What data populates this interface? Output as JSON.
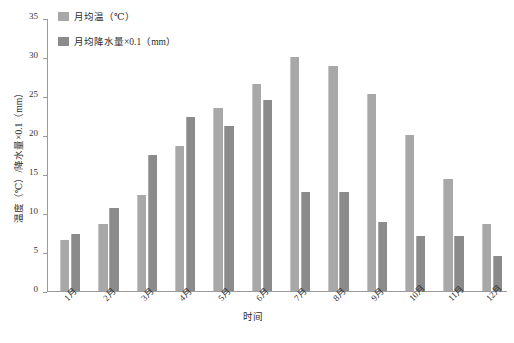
{
  "chart_data": {
    "type": "bar",
    "title": "",
    "xlabel": "时间",
    "ylabel": "温度（℃）/降水量×0.1（mm）",
    "categories": [
      "1月",
      "2月",
      "3月",
      "4月",
      "5月",
      "6月",
      "7月",
      "8月",
      "9月",
      "10月",
      "11月",
      "12月"
    ],
    "series": [
      {
        "name": "月均温（℃）",
        "color": "#a8a8a8",
        "values": [
          6.5,
          8.6,
          12.3,
          18.6,
          23.4,
          26.6,
          30.0,
          28.9,
          25.2,
          20.0,
          14.4,
          8.6
        ]
      },
      {
        "name": "月均降水量×0.1（mm）",
        "color": "#8b8b8b",
        "values": [
          7.3,
          10.6,
          17.5,
          22.3,
          21.1,
          24.5,
          12.7,
          12.7,
          8.8,
          7.0,
          7.0,
          4.5
        ]
      }
    ],
    "ylim": [
      0,
      35
    ],
    "ytick_values": [
      0,
      5,
      10,
      15,
      20,
      25,
      30,
      35
    ],
    "ytick_labels": [
      "0",
      "5",
      "10",
      "15",
      "20",
      "25",
      "30",
      "35"
    ],
    "grid": false,
    "legend_position": "top-left"
  }
}
